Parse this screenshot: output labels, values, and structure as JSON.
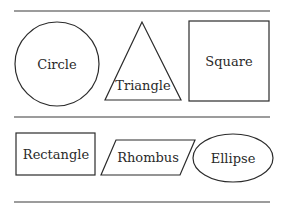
{
  "shapes": {
    "circle": {
      "label": "Circle"
    },
    "triangle": {
      "label": "Triangle"
    },
    "square": {
      "label": "Square"
    },
    "rectangle": {
      "label": "Rectangle"
    },
    "rhombus": {
      "label": "Rhombus"
    },
    "ellipse": {
      "label": "Ellipse"
    }
  }
}
